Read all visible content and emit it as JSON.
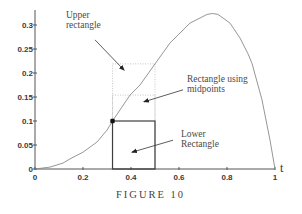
{
  "figure": {
    "caption": "FIGURE 10"
  },
  "colors": {
    "curve": "#8a8a8a",
    "solid_rect": "#3f3f3f",
    "dotted_rect": "#b8b8b8",
    "axis": "#555555",
    "arrow": "#333333",
    "marker": "#111111"
  },
  "chart_data": {
    "type": "line",
    "title": "",
    "xlabel": "t",
    "ylabel": "",
    "xlim": [
      0,
      1
    ],
    "ylim": [
      0,
      0.33
    ],
    "grid": false,
    "legend": null,
    "x_ticks": [
      0,
      0.2,
      0.4,
      0.6,
      0.8,
      1
    ],
    "x_tick_labels": [
      "0",
      "0.2",
      "0.4",
      "0.6",
      "0.8",
      "1"
    ],
    "y_ticks": [
      0,
      0.05,
      0.1,
      0.15,
      0.2,
      0.25,
      0.3
    ],
    "y_tick_labels": [
      "0",
      "0.05",
      "0.1",
      "0.15",
      "0.2",
      "0.25",
      "0.3"
    ],
    "series": [
      {
        "name": "curve",
        "x": [
          0,
          0.0625,
          0.117,
          0.146,
          0.2,
          0.258,
          0.3,
          0.323,
          0.396,
          0.4375,
          0.5,
          0.5625,
          0.646,
          0.717,
          0.74,
          0.7625,
          0.8125,
          0.854,
          0.8875,
          0.904,
          0.946,
          0.979,
          1.0
        ],
        "y": [
          0,
          0.004,
          0.0125,
          0.021,
          0.035,
          0.056,
          0.081,
          0.1,
          0.154,
          0.175,
          0.219,
          0.2625,
          0.304,
          0.322,
          0.324,
          0.322,
          0.304,
          0.273,
          0.24,
          0.22,
          0.144,
          0.06,
          0
        ]
      }
    ],
    "rectangles": [
      {
        "name": "lower-rectangle",
        "x0": 0.323,
        "x1": 0.5,
        "height": 0.1,
        "style": "solid"
      },
      {
        "name": "midpoint-rectangle",
        "x0": 0.323,
        "x1": 0.5,
        "height": 0.154,
        "style": "dotted"
      },
      {
        "name": "upper-rectangle",
        "x0": 0.323,
        "x1": 0.5,
        "height": 0.219,
        "style": "dotted"
      }
    ],
    "marker_point": {
      "x": 0.323,
      "y": 0.1
    },
    "annotations": [
      {
        "name": "upper-rectangle-label",
        "lines": [
          "Upper",
          "rectangle"
        ],
        "label_at": [
          0.129,
          0.315
        ],
        "arrow_from": [
          0.25,
          0.269
        ],
        "arrow_to": [
          0.371,
          0.206
        ]
      },
      {
        "name": "midpoint-rectangle-label",
        "lines": [
          "Rectangle using",
          "midpoints"
        ],
        "label_at": [
          0.633,
          0.181
        ],
        "arrow_from": [
          0.617,
          0.165
        ],
        "arrow_to": [
          0.454,
          0.14
        ]
      },
      {
        "name": "lower-rectangle-label",
        "lines": [
          "Lower",
          "Rectangle"
        ],
        "label_at": [
          0.608,
          0.067
        ],
        "arrow_from": [
          0.575,
          0.06
        ],
        "arrow_to": [
          0.404,
          0.035
        ]
      }
    ]
  }
}
